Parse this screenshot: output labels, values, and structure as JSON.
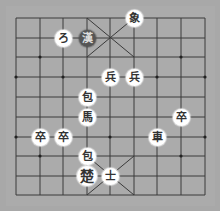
{
  "board": {
    "colors": {
      "background": "#a8a8a8",
      "lines": "#3a3a3a",
      "outer": "#bdbdbd",
      "piece_light": "#ffffff",
      "piece_dark": "#555555"
    },
    "columns_x": [
      16,
      40,
      63,
      87,
      110,
      134,
      157,
      181,
      205
    ],
    "rows_y": [
      18,
      38,
      57,
      77,
      97,
      117,
      137,
      156,
      176,
      195
    ]
  },
  "pieces": [
    {
      "id": "elephant-top",
      "glyph": "象",
      "col": 5,
      "row": 0,
      "style": "light"
    },
    {
      "id": "cannon-top",
      "glyph": "ろ",
      "col": 2,
      "row": 1,
      "style": "light"
    },
    {
      "id": "general-han",
      "glyph": "漢",
      "col": 3,
      "row": 1,
      "style": "dark"
    },
    {
      "id": "soldier-1",
      "glyph": "兵",
      "col": 4,
      "row": 3,
      "style": "light"
    },
    {
      "id": "soldier-2",
      "glyph": "兵",
      "col": 5,
      "row": 3,
      "style": "light"
    },
    {
      "id": "cannon-1",
      "glyph": "包",
      "col": 3,
      "row": 4,
      "style": "light"
    },
    {
      "id": "horse",
      "glyph": "馬",
      "col": 3,
      "row": 5,
      "style": "light"
    },
    {
      "id": "pawn-right",
      "glyph": "卒",
      "col": 7,
      "row": 5,
      "style": "light"
    },
    {
      "id": "pawn-left-1",
      "glyph": "卒",
      "col": 1,
      "row": 6,
      "style": "light"
    },
    {
      "id": "pawn-left-2",
      "glyph": "卒",
      "col": 2,
      "row": 6,
      "style": "light"
    },
    {
      "id": "chariot",
      "glyph": "車",
      "col": 6,
      "row": 6,
      "style": "light"
    },
    {
      "id": "cannon-2",
      "glyph": "包",
      "col": 3,
      "row": 7,
      "style": "light"
    },
    {
      "id": "general-chu",
      "glyph": "楚",
      "col": 3,
      "row": 8,
      "style": "light",
      "king": true
    },
    {
      "id": "advisor",
      "glyph": "士",
      "col": 4,
      "row": 8,
      "style": "light"
    }
  ]
}
